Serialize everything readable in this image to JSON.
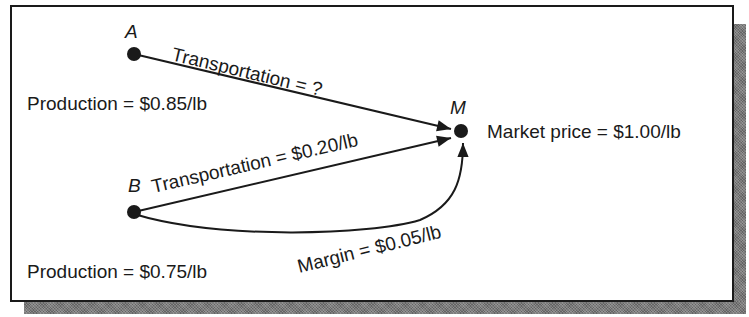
{
  "diagram": {
    "type": "flow",
    "colors": {
      "ink": "#1a1a1a",
      "background": "#ffffff",
      "shadow": "#7a7a7a"
    },
    "nodes": [
      {
        "id": "A",
        "label": "A",
        "x": 134,
        "y": 54,
        "note": "Production = $0.85/lb"
      },
      {
        "id": "B",
        "label": "B",
        "x": 134,
        "y": 212,
        "note": "Production = $0.75/lb"
      },
      {
        "id": "M",
        "label": "M",
        "x": 461,
        "y": 131,
        "note": "Market price = $1.00/lb"
      }
    ],
    "edges": [
      {
        "from": "A",
        "to": "M",
        "label": "Transportation = ?"
      },
      {
        "from": "B",
        "to": "M",
        "label": "Transportation = $0.20/lb"
      },
      {
        "from": "B",
        "to": "M",
        "label": "Margin = $0.05/lb",
        "curved": true
      }
    ]
  },
  "labels": {
    "node_a": "A",
    "node_b": "B",
    "node_m": "M",
    "production_a": "Production = $0.85/lb",
    "production_b": "Production = $0.75/lb",
    "market_price": "Market price = $1.00/lb",
    "transport_a": "Transportation = ?",
    "transport_b": "Transportation = $0.20/lb",
    "margin": "Margin = $0.05/lb"
  }
}
